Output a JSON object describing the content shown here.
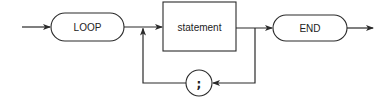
{
  "diagram": {
    "type": "syntax-diagram",
    "nodes": [
      {
        "id": "loop",
        "kind": "terminal",
        "shape": "rounded-pill",
        "label": "LOOP"
      },
      {
        "id": "statement",
        "kind": "non-terminal",
        "shape": "rectangle",
        "label": "statement"
      },
      {
        "id": "end",
        "kind": "terminal",
        "shape": "rounded-pill",
        "label": "END"
      },
      {
        "id": "separator",
        "kind": "terminal",
        "shape": "circle",
        "label": ";"
      }
    ],
    "edges": [
      {
        "from": "entry",
        "to": "loop"
      },
      {
        "from": "loop",
        "to": "statement"
      },
      {
        "from": "statement",
        "to": "end"
      },
      {
        "from": "statement",
        "to": "separator",
        "note": "loop-back path below"
      },
      {
        "from": "separator",
        "to": "statement",
        "note": "returns before statement"
      },
      {
        "from": "end",
        "to": "exit"
      }
    ]
  },
  "labels": {
    "loop": "LOOP",
    "statement": "statement",
    "end": "END",
    "separator": ";"
  },
  "colors": {
    "stroke": "#2a2a2a",
    "text": "#222222",
    "background": "#ffffff"
  }
}
